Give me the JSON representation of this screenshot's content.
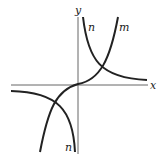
{
  "diagram": {
    "axes": {
      "x_label": "x",
      "y_label": "y"
    },
    "curves": [
      {
        "name": "m",
        "label": "m",
        "description": "cubic-like increasing curve through origin"
      },
      {
        "name": "n",
        "label": "n",
        "description": "hyperbola with branches in quadrants I and III"
      }
    ],
    "labels": {
      "m_top": "m",
      "n_top": "n",
      "n_bottom": "n"
    },
    "colors": {
      "curve": "#222222",
      "axis": "#666666"
    }
  }
}
